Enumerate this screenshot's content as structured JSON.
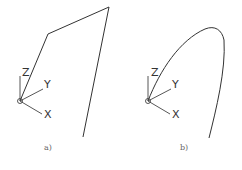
{
  "figure": {
    "panels": [
      {
        "label": "a)",
        "path_type": "polyline",
        "axes": {
          "x": "X",
          "y": "Y",
          "z": "Z"
        }
      },
      {
        "label": "b)",
        "path_type": "curve",
        "axes": {
          "x": "X",
          "y": "Y",
          "z": "Z"
        }
      }
    ],
    "caption": "",
    "colors": {
      "line": "#333333",
      "background": "#ffffff"
    }
  }
}
